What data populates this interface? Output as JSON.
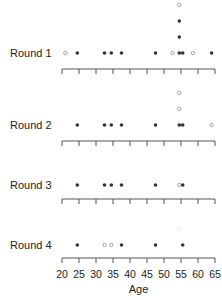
{
  "chart_data": {
    "type": "scatter",
    "subtype": "stacked dot plot (strip chart), one panel per round",
    "title": "",
    "xlabel": "Age",
    "ylabel": "",
    "xlim": [
      20,
      65
    ],
    "xticks": [
      20,
      25,
      30,
      35,
      40,
      45,
      50,
      55,
      60,
      65
    ],
    "grid": false,
    "legend": null,
    "marker_legend": {
      "filled": "filled dot",
      "open": "open circle"
    },
    "colors": {
      "filled": "#333333",
      "open": "#9a9a9a"
    },
    "rounds": [
      {
        "label": "Round 1",
        "points": [
          {
            "age": 21,
            "type": "open",
            "stack": 0
          },
          {
            "age": 24.5,
            "type": "filled",
            "stack": 0
          },
          {
            "age": 32.5,
            "type": "filled",
            "stack": 0
          },
          {
            "age": 34.5,
            "type": "filled",
            "stack": 0
          },
          {
            "age": 37.5,
            "type": "filled",
            "stack": 0
          },
          {
            "age": 47.5,
            "type": "filled",
            "stack": 0
          },
          {
            "age": 52.5,
            "type": "open",
            "stack": 0
          },
          {
            "age": 54.5,
            "type": "filled",
            "stack": 0
          },
          {
            "age": 54.5,
            "type": "filled",
            "stack": 1
          },
          {
            "age": 54.5,
            "type": "filled",
            "stack": 2
          },
          {
            "age": 54.5,
            "type": "open",
            "stack": 3
          },
          {
            "age": 55.5,
            "type": "filled",
            "stack": 0
          },
          {
            "age": 58.5,
            "type": "open",
            "stack": 0
          },
          {
            "age": 64,
            "type": "filled",
            "stack": 0
          }
        ]
      },
      {
        "label": "Round 2",
        "points": [
          {
            "age": 24.5,
            "type": "filled",
            "stack": 0
          },
          {
            "age": 32.5,
            "type": "filled",
            "stack": 0
          },
          {
            "age": 34.5,
            "type": "filled",
            "stack": 0
          },
          {
            "age": 37.5,
            "type": "filled",
            "stack": 0
          },
          {
            "age": 47.5,
            "type": "filled",
            "stack": 0
          },
          {
            "age": 54.5,
            "type": "filled",
            "stack": 0
          },
          {
            "age": 54.5,
            "type": "open",
            "stack": 1
          },
          {
            "age": 54.5,
            "type": "open",
            "stack": 2
          },
          {
            "age": 55.5,
            "type": "filled",
            "stack": 0
          },
          {
            "age": 64,
            "type": "open",
            "stack": 0
          }
        ]
      },
      {
        "label": "Round 3",
        "points": [
          {
            "age": 24.5,
            "type": "filled",
            "stack": 0
          },
          {
            "age": 32.5,
            "type": "filled",
            "stack": 0
          },
          {
            "age": 34.5,
            "type": "filled",
            "stack": 0
          },
          {
            "age": 37.5,
            "type": "filled",
            "stack": 0
          },
          {
            "age": 47.5,
            "type": "filled",
            "stack": 0
          },
          {
            "age": 54.5,
            "type": "open",
            "stack": 0
          },
          {
            "age": 55.5,
            "type": "filled",
            "stack": 0
          }
        ]
      },
      {
        "label": "Round 4",
        "points": [
          {
            "age": 24.5,
            "type": "filled",
            "stack": 0
          },
          {
            "age": 32.5,
            "type": "open",
            "stack": 0
          },
          {
            "age": 34.5,
            "type": "open",
            "stack": 0
          },
          {
            "age": 37.5,
            "type": "filled",
            "stack": 0
          },
          {
            "age": 47.5,
            "type": "filled",
            "stack": 0
          },
          {
            "age": 54.5,
            "type": "faint",
            "stack": 1
          },
          {
            "age": 55.5,
            "type": "filled",
            "stack": 0
          }
        ]
      }
    ]
  },
  "layout": {
    "x0_px": 62,
    "px_per_year": 3.4,
    "round_dot_y": [
      53,
      125,
      185,
      245
    ],
    "round_axis_y": [
      69,
      141,
      199,
      258
    ],
    "stack_step_px": 16,
    "label_x": 10,
    "tick_label_y": 278,
    "axis_title_y": 293
  }
}
